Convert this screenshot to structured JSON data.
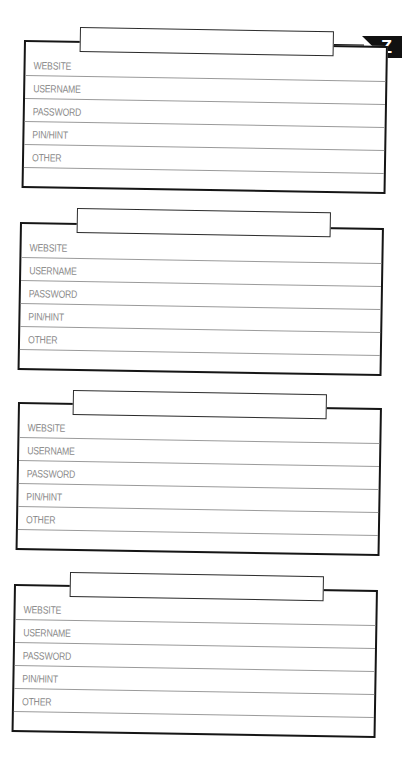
{
  "page": {
    "section_letter": "Z"
  },
  "fields": {
    "website": "WEBSITE",
    "username": "USERNAME",
    "password": "PASSWORD",
    "pin_hint": "PIN/HINT",
    "other": "OTHER"
  },
  "cards": [
    {
      "title": "",
      "website": "",
      "username": "",
      "password": "",
      "pin_hint": "",
      "other": "",
      "notes": ""
    },
    {
      "title": "",
      "website": "",
      "username": "",
      "password": "",
      "pin_hint": "",
      "other": "",
      "notes": ""
    },
    {
      "title": "",
      "website": "",
      "username": "",
      "password": "",
      "pin_hint": "",
      "other": "",
      "notes": ""
    },
    {
      "title": "",
      "website": "",
      "username": "",
      "password": "",
      "pin_hint": "",
      "other": "",
      "notes": ""
    }
  ],
  "colors": {
    "border": "#151515",
    "label": "#8a8a8a",
    "rule": "#9a9a9a",
    "badge": "#111111"
  }
}
